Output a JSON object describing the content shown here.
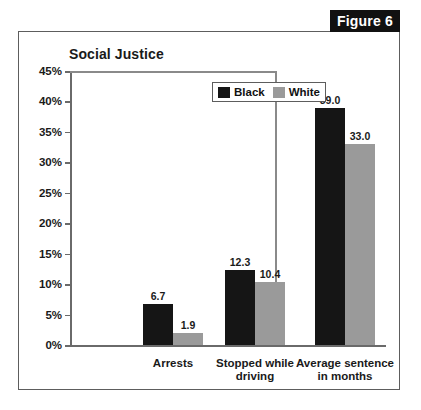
{
  "figure": {
    "tab_label": "Figure 6"
  },
  "chart_data": {
    "type": "bar",
    "title": "Social Justice",
    "xlabel": "",
    "ylabel": "",
    "ylim": [
      0,
      45
    ],
    "grid": false,
    "legend_position": "top-right-inside",
    "y_ticks": [
      "0%",
      "5%",
      "10%",
      "15%",
      "20%",
      "25%",
      "30%",
      "35%",
      "40%",
      "45%"
    ],
    "y_tick_values": [
      0,
      5,
      10,
      15,
      20,
      25,
      30,
      35,
      40,
      45
    ],
    "categories": [
      "Arrests",
      "Stopped while driving",
      "Average sentence in months"
    ],
    "category_lines": [
      [
        "Arrests"
      ],
      [
        "Stopped while",
        "driving"
      ],
      [
        "Average sentence",
        "in months"
      ]
    ],
    "series": [
      {
        "name": "Black",
        "color": "#151515",
        "values": [
          6.7,
          39.0,
          12.3
        ],
        "labels": [
          "6.7",
          "12.3",
          "39.0"
        ],
        "values_ordered": [
          6.7,
          12.3,
          39.0
        ]
      },
      {
        "name": "White",
        "color": "#9a9a9a",
        "values": [
          1.9,
          10.4,
          33.0
        ],
        "labels": [
          "1.9",
          "10.4",
          "33.0"
        ],
        "values_ordered": [
          1.9,
          10.4,
          33.0
        ]
      }
    ],
    "data_points": [
      {
        "category": "Arrests",
        "Black": 6.7,
        "White": 1.9
      },
      {
        "category": "Stopped while driving",
        "Black": 12.3,
        "White": 10.4
      },
      {
        "category": "Average sentence in months",
        "Black": 39.0,
        "White": 33.0
      }
    ],
    "legend": [
      {
        "label": "Black",
        "color": "#151515"
      },
      {
        "label": "White",
        "color": "#9a9a9a"
      }
    ],
    "annotations": {
      "note": "Third category uses a separate scale (months), divided by a vertical rule."
    }
  }
}
